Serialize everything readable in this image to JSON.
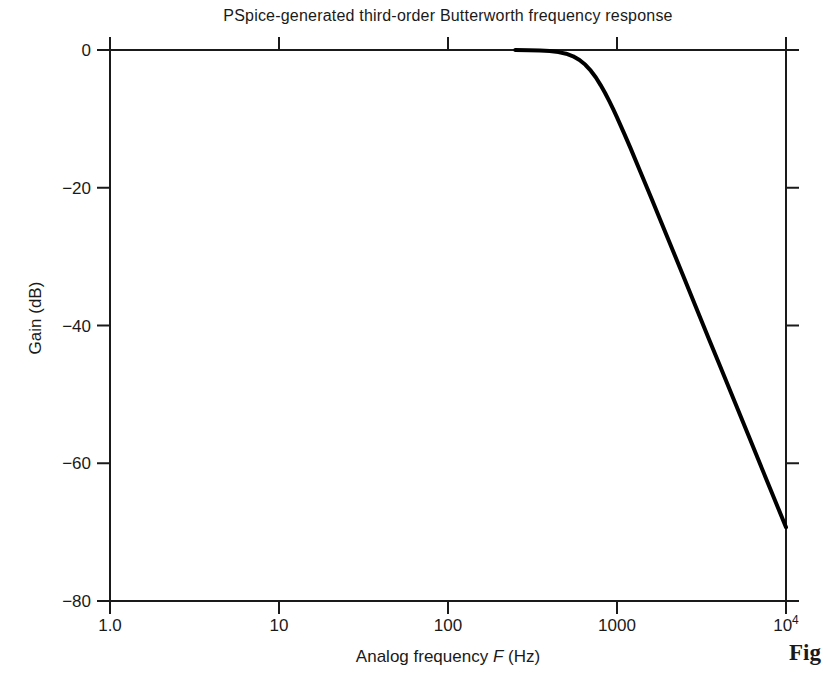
{
  "figure_caption": "Fig",
  "colors": {
    "background": "#ffffff",
    "axis": "#1a1a1a",
    "text": "#1a1a1a",
    "curve": "#000000"
  },
  "chart_data": {
    "type": "line",
    "title": "PSpice-generated third-order Butterworth frequency response",
    "xlabel": "Analog frequency F (Hz)",
    "xlabel_parts": {
      "pre": "Analog frequency ",
      "italic": "F",
      "post": " (Hz)"
    },
    "ylabel": "Gain (dB)",
    "x_scale": "log",
    "xlim": [
      1,
      10000
    ],
    "ylim": [
      -80,
      0
    ],
    "grid": false,
    "legend": "none",
    "x_ticks": [
      {
        "value": 1,
        "label": "1.0"
      },
      {
        "value": 10,
        "label": "10"
      },
      {
        "value": 100,
        "label": "100"
      },
      {
        "value": 1000,
        "label": "1000"
      },
      {
        "value": 10000,
        "label": "10^4"
      }
    ],
    "y_ticks": [
      {
        "value": 0,
        "label": "0"
      },
      {
        "value": -20,
        "label": "−20"
      },
      {
        "value": -40,
        "label": "−40"
      },
      {
        "value": -60,
        "label": "−60"
      },
      {
        "value": -80,
        "label": "−80"
      }
    ],
    "series": [
      {
        "name": "Third-order Butterworth lowpass gain",
        "color": "#000000",
        "points": [
          [
            1,
            0
          ],
          [
            10,
            0
          ],
          [
            50,
            0
          ],
          [
            100,
            0
          ],
          [
            150,
            0
          ],
          [
            200,
            0
          ],
          [
            250,
            -0.01
          ],
          [
            300,
            -0.03
          ],
          [
            350,
            -0.07
          ],
          [
            400,
            -0.15
          ],
          [
            450,
            -0.3
          ],
          [
            500,
            -0.54
          ],
          [
            550,
            -0.92
          ],
          [
            600,
            -1.45
          ],
          [
            650,
            -2.15
          ],
          [
            700,
            -3.01
          ],
          [
            750,
            -4.0
          ],
          [
            800,
            -5.09
          ],
          [
            850,
            -6.24
          ],
          [
            900,
            -7.43
          ],
          [
            950,
            -8.6
          ],
          [
            1000,
            -9.78
          ],
          [
            1100,
            -12.06
          ],
          [
            1200,
            -14.21
          ],
          [
            1400,
            -18.13
          ],
          [
            1600,
            -21.57
          ],
          [
            1800,
            -24.62
          ],
          [
            2000,
            -27.36
          ],
          [
            2500,
            -33.17
          ],
          [
            3000,
            -37.92
          ],
          [
            3500,
            -41.94
          ],
          [
            4000,
            -45.42
          ],
          [
            5000,
            -51.23
          ],
          [
            6000,
            -55.98
          ],
          [
            7000,
            -60.0
          ],
          [
            8000,
            -63.48
          ],
          [
            9000,
            -66.55
          ],
          [
            10000,
            -69.29
          ]
        ]
      }
    ]
  }
}
